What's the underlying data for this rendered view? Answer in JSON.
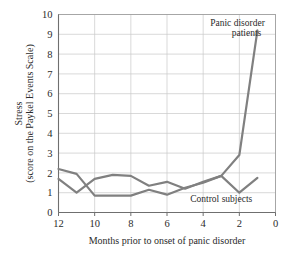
{
  "chart_data": {
    "type": "line",
    "title": "",
    "subtitle": "",
    "xlabel": "Months prior to onset of panic disorder",
    "ylabel_line1": "Stress",
    "ylabel_line2": "(score on the Paykel Events Scale)",
    "xlim": [
      12,
      0
    ],
    "ylim": [
      0,
      10
    ],
    "x_ticks": [
      12,
      10,
      8,
      6,
      4,
      2,
      0
    ],
    "x_tick_labels": [
      "12",
      "10",
      "8",
      "6",
      "4",
      "2",
      "0"
    ],
    "y_ticks": [
      0,
      1,
      2,
      3,
      4,
      5,
      6,
      7,
      8,
      9,
      10
    ],
    "y_tick_labels": [
      "0",
      "1",
      "2",
      "3",
      "4",
      "5",
      "6",
      "7",
      "8",
      "9",
      "10"
    ],
    "x_axis_direction": "reversed",
    "grid": true,
    "grid_color": "#c9c9c9",
    "legend_position": "inline-annotations",
    "line_color": "#808080",
    "line_width": 2.2,
    "x": [
      12,
      11,
      10,
      9,
      8,
      7,
      6,
      5,
      4,
      3,
      2,
      1
    ],
    "series": [
      {
        "name": "Panic disorder patients",
        "values": [
          1.7,
          1.0,
          1.7,
          1.9,
          1.85,
          1.35,
          1.55,
          1.2,
          1.55,
          1.85,
          2.9,
          9.2
        ]
      },
      {
        "name": "Control subjects",
        "values": [
          2.2,
          1.95,
          0.85,
          0.85,
          0.85,
          1.15,
          0.9,
          1.25,
          1.5,
          1.85,
          1.0,
          1.75
        ]
      }
    ],
    "annotations": [
      {
        "text_line1": "Panic disorder",
        "text_line2": "patients",
        "x": 2.1,
        "y": 9.4
      },
      {
        "text_line1": "Control subjects",
        "text_line2": "",
        "x": 3.0,
        "y": 0.55
      }
    ]
  }
}
